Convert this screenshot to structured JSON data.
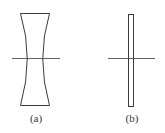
{
  "figure": {
    "panels": [
      {
        "id": "a",
        "label": "(a)",
        "shape": "concave-lens"
      },
      {
        "id": "b",
        "label": "(b)",
        "shape": "flat-plate"
      }
    ],
    "colors": {
      "stroke": "#3a3a3a",
      "background": "#ffffff"
    }
  }
}
